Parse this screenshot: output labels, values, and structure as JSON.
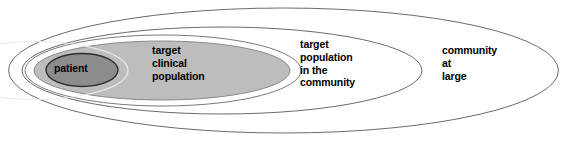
{
  "diagram": {
    "type": "nested-ellipse-venn",
    "title": "",
    "background_color": "#ffffff",
    "regions": [
      {
        "id": "patient",
        "label": "patient",
        "level": 1,
        "fill_color": "#8c8c8c",
        "stroke_color": "#3a3a3a",
        "label_lines": [
          "patient"
        ]
      },
      {
        "id": "target-clinical-population",
        "label": "target\nclinical\npopulation",
        "level": 2,
        "fill_color": "#bdbdbd",
        "stroke_color": "#efefef",
        "label_lines": [
          "target",
          "clinical",
          "population"
        ]
      },
      {
        "id": "target-population-in-the-community",
        "label": "target\npopulation\nin the\ncommunity",
        "level": 3,
        "fill_color": "#ffffff",
        "stroke_color": "#6b6b6b",
        "label_lines": [
          "target",
          "population",
          "in the",
          "community"
        ]
      },
      {
        "id": "community-at-large",
        "label": "community\nat\nlarge",
        "level": 4,
        "fill_color": "#ffffff",
        "stroke_color": "#6b6b6b",
        "label_lines": [
          "community",
          "at",
          "large"
        ]
      }
    ]
  },
  "labels": {
    "patient": "patient",
    "target_clinical_population": "target\nclinical\npopulation",
    "target_population_in_the_community": "target\npopulation\nin the\ncommunity",
    "community_at_large": "community\nat\nlarge"
  },
  "colors": {
    "outer_stroke": "#6b6b6b",
    "clinical_fill": "#bdbdbd",
    "patient_fill": "#8c8c8c",
    "patient_stroke": "#3a3a3a",
    "text": "#000000",
    "page_background": "#ffffff"
  }
}
